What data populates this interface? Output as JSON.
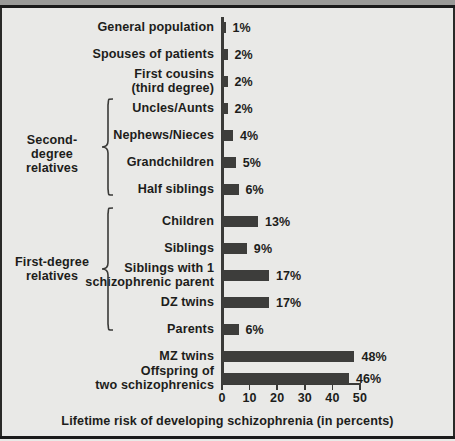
{
  "chart_data": {
    "type": "bar",
    "orientation": "horizontal",
    "title": "",
    "xlabel": "Lifetime risk of developing schizophrenia (in percents)",
    "ylabel": "",
    "xlim": [
      0,
      50
    ],
    "xticks": [
      0,
      10,
      20,
      30,
      40,
      50
    ],
    "xtick_labels": [
      "0",
      "10",
      "20",
      "30",
      "40",
      "50"
    ],
    "grid": false,
    "legend": "none",
    "value_suffix": "%",
    "bar_color": "#3d3d3b",
    "background_color": "#e9e9e7",
    "axis_color": "#3a3a38",
    "categories": [
      "General population",
      "Spouses of patients",
      "First cousins\n(third degree)",
      "Uncles/Aunts",
      "Nephews/Nieces",
      "Grandchildren",
      "Half siblings",
      "Children",
      "Siblings",
      "Siblings with 1\nschizophrenic parent",
      "DZ twins",
      "Parents",
      "MZ twins",
      "Offspring of\ntwo schizophrenics"
    ],
    "values": [
      1,
      2,
      2,
      2,
      4,
      5,
      6,
      13,
      9,
      17,
      17,
      6,
      48,
      46
    ],
    "value_labels": [
      "1%",
      "2%",
      "2%",
      "2%",
      "4%",
      "5%",
      "6%",
      "13%",
      "9%",
      "17%",
      "17%",
      "6%",
      "48%",
      "46%"
    ],
    "annotations": [
      {
        "label": "Second-degree\nrelatives",
        "covers": [
          "Uncles/Aunts",
          "Nephews/Nieces",
          "Grandchildren",
          "Half siblings"
        ]
      },
      {
        "label": "First-degree\nrelatives",
        "covers": [
          "Children",
          "Siblings",
          "Siblings with 1 schizophrenic parent",
          "DZ twins",
          "Parents"
        ]
      }
    ]
  },
  "groups": {
    "second_degree": "Second-degree\nrelatives",
    "first_degree": "First-degree\nrelatives"
  }
}
